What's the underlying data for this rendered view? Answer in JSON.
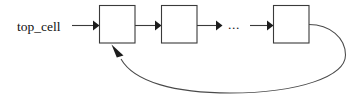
{
  "diagram": {
    "background_color": "#ffffff",
    "line_color": "#3a3a3a",
    "text_color": "#111111",
    "source_label": "top_cell",
    "ellipsis": "...",
    "nodes": [
      {
        "id": "cell-1",
        "label": ""
      },
      {
        "id": "cell-2",
        "label": ""
      },
      {
        "id": "cell-3",
        "label": ""
      }
    ],
    "connections": [
      {
        "from": "top_cell",
        "to": "cell-1",
        "kind": "arrow"
      },
      {
        "from": "cell-1",
        "to": "cell-2",
        "kind": "arrow"
      },
      {
        "from": "cell-2",
        "to": "ellipsis",
        "kind": "arrow"
      },
      {
        "from": "ellipsis",
        "to": "cell-3",
        "kind": "arrow"
      },
      {
        "from": "cell-3",
        "to": "cell-1",
        "kind": "feedback-curve"
      }
    ]
  }
}
